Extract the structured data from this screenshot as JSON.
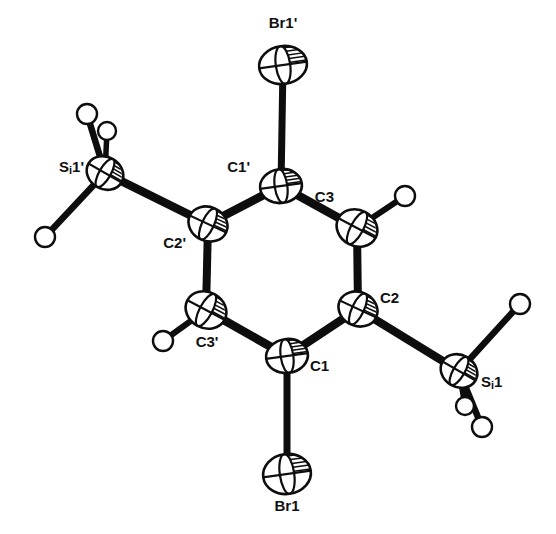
{
  "figure": {
    "type": "ortep-thermal-ellipsoid-plot",
    "title": "",
    "background_color": "#ffffff",
    "line_color": "#0d0d0d",
    "label_color": "#111111",
    "width": 556,
    "height": 534
  },
  "atoms": [
    {
      "id": "Br1p",
      "label": "Br1'",
      "element": "Br",
      "x": 283,
      "y": 65,
      "rx": 24,
      "ry": 19,
      "rot": -8,
      "kind": "ellipsoid",
      "label_x": 283,
      "label_y": 28,
      "label_anchor": "middle"
    },
    {
      "id": "C1p",
      "label": "C1'",
      "element": "C",
      "x": 281,
      "y": 186,
      "rx": 21,
      "ry": 17,
      "rot": -8,
      "kind": "ellipsoid",
      "label_x": 250,
      "label_y": 172,
      "label_anchor": "end"
    },
    {
      "id": "C3",
      "label": "C3",
      "element": "C",
      "x": 357,
      "y": 228,
      "rx": 21,
      "ry": 18,
      "rot": 28,
      "kind": "ellipsoid",
      "label_x": 334,
      "label_y": 202,
      "label_anchor": "end"
    },
    {
      "id": "C2",
      "label": "C2",
      "element": "C",
      "x": 358,
      "y": 309,
      "rx": 20,
      "ry": 17,
      "rot": 25,
      "kind": "ellipsoid",
      "label_x": 380,
      "label_y": 303,
      "label_anchor": "start"
    },
    {
      "id": "C1",
      "label": "C1",
      "element": "C",
      "x": 287,
      "y": 356,
      "rx": 21,
      "ry": 17,
      "rot": -8,
      "kind": "ellipsoid",
      "label_x": 310,
      "label_y": 371,
      "label_anchor": "start"
    },
    {
      "id": "C3p",
      "label": "C3'",
      "element": "C",
      "x": 206,
      "y": 310,
      "rx": 21,
      "ry": 18,
      "rot": 28,
      "kind": "ellipsoid",
      "label_x": 207,
      "label_y": 347,
      "label_anchor": "middle"
    },
    {
      "id": "C2p",
      "label": "C2'",
      "element": "C",
      "x": 208,
      "y": 224,
      "rx": 20,
      "ry": 17,
      "rot": 25,
      "kind": "ellipsoid",
      "label_x": 186,
      "label_y": 248,
      "label_anchor": "end"
    },
    {
      "id": "Br1",
      "label": "Br1",
      "element": "Br",
      "x": 287,
      "y": 474,
      "rx": 24,
      "ry": 20,
      "rot": -8,
      "kind": "ellipsoid",
      "label_x": 287,
      "label_y": 511,
      "label_anchor": "middle"
    },
    {
      "id": "Si1",
      "label": "Si1",
      "element": "Si",
      "x": 459,
      "y": 371,
      "rx": 19,
      "ry": 16,
      "rot": 30,
      "kind": "ellipsoid",
      "label_x": 481,
      "label_y": 387,
      "label_anchor": "start"
    },
    {
      "id": "Si1p",
      "label": "Si1'",
      "element": "Si",
      "x": 105,
      "y": 173,
      "rx": 19,
      "ry": 16,
      "rot": 30,
      "kind": "ellipsoid",
      "label_x": 84,
      "label_y": 172,
      "label_anchor": "end"
    },
    {
      "id": "H3",
      "label": "",
      "element": "H",
      "x": 405,
      "y": 196,
      "r": 10,
      "kind": "sphere"
    },
    {
      "id": "H3p",
      "label": "",
      "element": "H",
      "x": 163,
      "y": 341,
      "r": 10,
      "kind": "sphere"
    },
    {
      "id": "HSi1a",
      "label": "",
      "element": "H",
      "x": 520,
      "y": 304,
      "r": 10,
      "kind": "sphere"
    },
    {
      "id": "HSi1b",
      "label": "",
      "element": "H",
      "x": 465,
      "y": 406,
      "r": 9,
      "kind": "sphere"
    },
    {
      "id": "HSi1c",
      "label": "",
      "element": "H",
      "x": 482,
      "y": 427,
      "r": 10,
      "kind": "sphere"
    },
    {
      "id": "HSi1pa",
      "label": "",
      "element": "H",
      "x": 87,
      "y": 114,
      "r": 10,
      "kind": "sphere"
    },
    {
      "id": "HSi1pb",
      "label": "",
      "element": "H",
      "x": 107,
      "y": 131,
      "r": 9,
      "kind": "sphere"
    },
    {
      "id": "HSi1pc",
      "label": "",
      "element": "H",
      "x": 45,
      "y": 237,
      "r": 10,
      "kind": "sphere"
    }
  ],
  "bonds": [
    {
      "from": "Br1p",
      "to": "C1p",
      "width": 7,
      "type": "heavy"
    },
    {
      "from": "C1p",
      "to": "C3",
      "width": 8.5,
      "type": "heavy"
    },
    {
      "from": "C3",
      "to": "C2",
      "width": 8,
      "type": "heavy"
    },
    {
      "from": "C2",
      "to": "C1",
      "width": 8.5,
      "type": "heavy"
    },
    {
      "from": "C1",
      "to": "C3p",
      "width": 8.5,
      "type": "heavy"
    },
    {
      "from": "C3p",
      "to": "C2p",
      "width": 8,
      "type": "heavy"
    },
    {
      "from": "C2p",
      "to": "C1p",
      "width": 8.5,
      "type": "heavy"
    },
    {
      "from": "C1",
      "to": "Br1",
      "width": 7,
      "type": "heavy"
    },
    {
      "from": "C2",
      "to": "Si1",
      "width": 8.5,
      "type": "heavy"
    },
    {
      "from": "C2p",
      "to": "Si1p",
      "width": 8.5,
      "type": "heavy"
    },
    {
      "from": "C3",
      "to": "H3",
      "width": 6,
      "type": "hydrogen"
    },
    {
      "from": "C3p",
      "to": "H3p",
      "width": 6,
      "type": "hydrogen"
    },
    {
      "from": "Si1",
      "to": "HSi1a",
      "width": 6.5,
      "type": "hydrogen"
    },
    {
      "from": "Si1",
      "to": "HSi1b",
      "width": 5.5,
      "type": "hydrogen"
    },
    {
      "from": "Si1",
      "to": "HSi1c",
      "width": 6.5,
      "type": "hydrogen"
    },
    {
      "from": "Si1p",
      "to": "HSi1pa",
      "width": 6.5,
      "type": "hydrogen"
    },
    {
      "from": "Si1p",
      "to": "HSi1pb",
      "width": 5.5,
      "type": "hydrogen"
    },
    {
      "from": "Si1p",
      "to": "HSi1pc",
      "width": 6.5,
      "type": "hydrogen"
    }
  ]
}
